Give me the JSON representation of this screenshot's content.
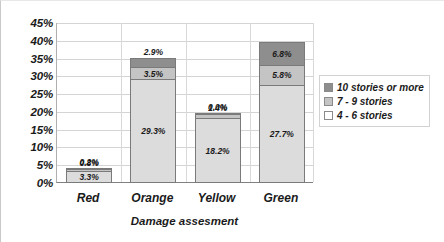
{
  "chart_data": {
    "type": "bar",
    "subtype": "stacked-vertical",
    "title": "",
    "xlabel": "Damage assesment",
    "ylabel": "",
    "ylim": [
      0,
      45
    ],
    "ytick_step": 5,
    "ytick_labels": [
      "45%",
      "40%",
      "35%",
      "30%",
      "25%",
      "20%",
      "15%",
      "10%",
      "5%",
      "0%"
    ],
    "ytick_values": [
      45,
      40,
      35,
      30,
      25,
      20,
      15,
      10,
      5,
      0
    ],
    "grid": true,
    "legend_position": "right",
    "categories": [
      "Red",
      "Orange",
      "Yellow",
      "Green"
    ],
    "series": [
      {
        "name": "4 - 6 stories",
        "color": "#dcdcdc",
        "values": [
          3.3,
          29.3,
          18.2,
          27.7
        ],
        "labels": [
          "3.3%",
          "29.3%",
          "18.2%",
          "27.7%"
        ]
      },
      {
        "name": "7 - 9 stories",
        "color": "#c4c4c4",
        "values": [
          0.8,
          3.5,
          1.4,
          5.8
        ],
        "labels": [
          "0.8%",
          "3.5%",
          "1.4%",
          "5.8%"
        ]
      },
      {
        "name": "10 stories or more",
        "color": "#8e8e8e",
        "values": [
          0.2,
          2.9,
          0.0,
          6.8
        ],
        "labels": [
          "0.2%",
          "2.9%",
          "0.0%",
          "6.8%"
        ]
      }
    ],
    "totals": [
      4.3,
      35.7,
      19.6,
      40.3
    ]
  },
  "legend": {
    "entries": [
      {
        "label": "10 stories or more",
        "swatch": "s2"
      },
      {
        "label": "7 - 9 stories",
        "swatch": "s1"
      },
      {
        "label": "4 - 6 stories",
        "swatch": "s0"
      }
    ]
  }
}
